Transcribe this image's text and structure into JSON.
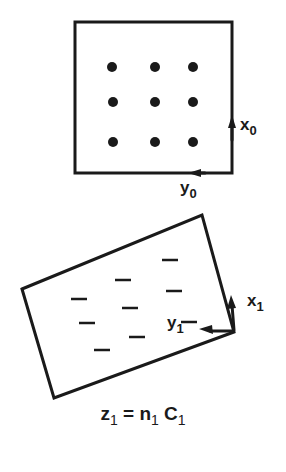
{
  "diagram": {
    "type": "coordinate-frame-illustration",
    "colors": {
      "ink": "#1a1a1a",
      "background": "#ffffff"
    },
    "frame0": {
      "name": "object frame",
      "square": {
        "x": 75,
        "y": 22,
        "w": 157,
        "h": 151
      },
      "dots": [
        [
          112,
          67
        ],
        [
          155,
          67
        ],
        [
          193,
          67
        ],
        [
          113,
          102
        ],
        [
          155,
          102
        ],
        [
          193,
          102
        ],
        [
          113,
          142
        ],
        [
          155,
          142
        ],
        [
          193,
          142
        ]
      ],
      "axes": {
        "x": {
          "label": "x",
          "subscript": "0",
          "direction": "up"
        },
        "y": {
          "label": "y",
          "subscript": "0",
          "direction": "left"
        }
      }
    },
    "frame1": {
      "name": "image frame",
      "polygon": [
        [
          22,
          289
        ],
        [
          202,
          215
        ],
        [
          234,
          332
        ],
        [
          54,
          398
        ]
      ],
      "dashes": [
        [
          170,
          260
        ],
        [
          123,
          280
        ],
        [
          174,
          291
        ],
        [
          79,
          299
        ],
        [
          130,
          308
        ],
        [
          87,
          323
        ],
        [
          137,
          337
        ],
        [
          102,
          350
        ],
        [
          189,
          322
        ]
      ],
      "axes": {
        "x": {
          "label": "x",
          "subscript": "1",
          "direction": "up"
        },
        "y": {
          "label": "y",
          "subscript": "1",
          "direction": "left"
        }
      }
    },
    "equation": {
      "lhs": "z",
      "lhs_sub": "1",
      "op": "=",
      "n": "n",
      "n_sub": "1",
      "c": "C",
      "c_sub": "1"
    }
  }
}
